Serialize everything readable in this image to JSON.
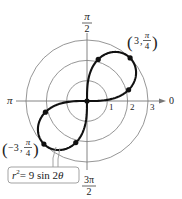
{
  "diagram": {
    "type": "polar_graph",
    "equation": {
      "lhs_var": "r",
      "lhs_exp": "2",
      "rhs": "= 9 sin 2",
      "rhs_var": "θ"
    },
    "axis_labels": {
      "top": {
        "num": "π",
        "den": "2"
      },
      "bottom": {
        "num": "3π",
        "den": "2"
      },
      "left": "π",
      "right": "0"
    },
    "radial_ticks": [
      "1",
      "2",
      "3"
    ],
    "point_labels": {
      "upper": {
        "r": "3",
        "theta_num": "π",
        "theta_den": "4"
      },
      "lower": {
        "r": "−3",
        "theta_num": "π",
        "theta_den": "4"
      }
    },
    "colors": {
      "curve": "#111111",
      "grid": "#888888",
      "axis": "#777777",
      "box_border": "#999999"
    }
  }
}
